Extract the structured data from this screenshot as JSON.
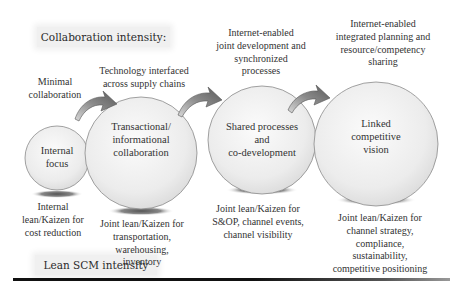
{
  "diagram": {
    "top_label": "Collaboration intensity:",
    "bottom_label": "Lean SCM intensity",
    "stages": [
      {
        "name": "internal-focus",
        "circle_text": [
          "Internal",
          "focus"
        ],
        "collaboration_text": [
          "Minimal",
          "collaboration"
        ],
        "lean_text": [
          "Internal",
          "lean/Kaizen for",
          "cost reduction"
        ]
      },
      {
        "name": "transactional-informational-collaboration",
        "circle_text": [
          "Transactional/",
          "informational",
          "collaboration"
        ],
        "collaboration_text": [
          "Technology interfaced",
          "across supply chains"
        ],
        "lean_text": [
          "Joint lean/Kaizen for",
          "transportation,",
          "warehousing,",
          "inventory"
        ]
      },
      {
        "name": "shared-processes-co-development",
        "circle_text": [
          "Shared processes",
          "and",
          "co-development"
        ],
        "collaboration_text": [
          "Internet-enabled",
          "joint development and",
          "synchronized",
          "processes"
        ],
        "lean_text": [
          "Joint lean/Kaizen for",
          "S&OP, channel events,",
          "channel visibility"
        ]
      },
      {
        "name": "linked-competitive-vision",
        "circle_text": [
          "Linked",
          "competitive",
          "vision"
        ],
        "collaboration_text": [
          "Internet-enabled",
          "integrated planning and",
          "resource/competency",
          "sharing"
        ],
        "lean_text": [
          "Joint lean/Kaizen for",
          "channel strategy,",
          "compliance,",
          "sustainability,",
          "competitive positioning"
        ]
      }
    ],
    "colors": {
      "circle_fill_center": "#fafafa",
      "circle_fill_edge": "#e2e2e2",
      "circle_stroke": "#8a8a8a",
      "arrow_fill": "#8c8c8c",
      "label_box_bg": "#f0f0f0",
      "baseline": "#111111"
    }
  }
}
